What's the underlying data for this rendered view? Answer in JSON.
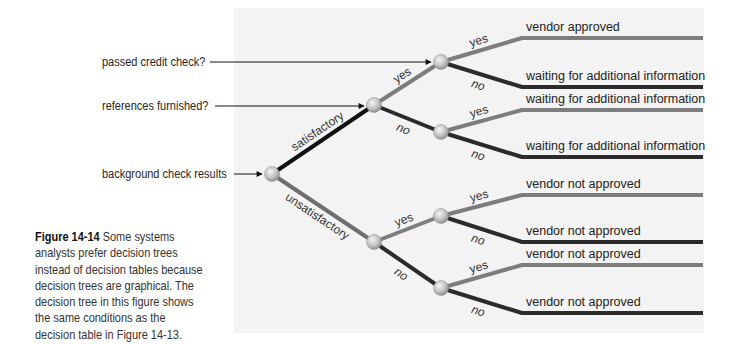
{
  "figure": {
    "caption_title": "Figure 14-14",
    "caption_body": " Some systems analysts prefer decision trees instead of decision tables because decision trees are graphical. The decision tree in this figure shows the same conditions as the decision table in Figure 14-13."
  },
  "conditions": [
    {
      "id": "credit",
      "label": "passed credit check?"
    },
    {
      "id": "refs",
      "label": "references furnished?"
    },
    {
      "id": "background",
      "label": "background check results"
    }
  ],
  "colors": {
    "satisfactory_branch": "#111111",
    "yes_branch": "#7d7d7d",
    "no_branch": "#2b2b2b",
    "unsatisfactory_branch": "#6e6e6e",
    "node_fill": "#c9c9c9",
    "panel_bg": "#f3f3f3"
  },
  "tree": {
    "root_condition": "background check results",
    "branches": [
      {
        "label": "satisfactory",
        "condition": "references furnished?",
        "branches": [
          {
            "label": "yes",
            "condition": "passed credit check?",
            "outcomes": [
              {
                "label": "yes",
                "result": "vendor approved"
              },
              {
                "label": "no",
                "result": "waiting for additional information"
              }
            ]
          },
          {
            "label": "no",
            "outcomes": [
              {
                "label": "yes",
                "result": "waiting for additional information"
              },
              {
                "label": "no",
                "result": "waiting for additional information"
              }
            ]
          }
        ]
      },
      {
        "label": "unsatisfactory",
        "branches": [
          {
            "label": "yes",
            "outcomes": [
              {
                "label": "yes",
                "result": "vendor not approved"
              },
              {
                "label": "no",
                "result": "vendor not approved"
              }
            ]
          },
          {
            "label": "no",
            "outcomes": [
              {
                "label": "yes",
                "result": "vendor not approved"
              },
              {
                "label": "no",
                "result": "vendor not approved"
              }
            ]
          }
        ]
      }
    ]
  }
}
